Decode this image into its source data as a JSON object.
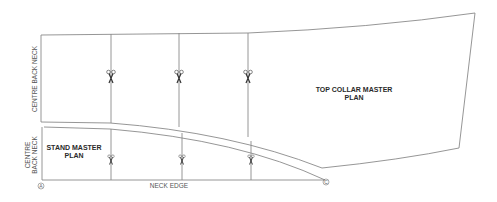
{
  "diagram": {
    "type": "pattern-drafting",
    "pieces": [
      {
        "name": "top-collar",
        "label_line1": "TOP COLLAR MASTER",
        "label_line2": "PLAN"
      },
      {
        "name": "stand",
        "label_line1": "STAND MASTER",
        "label_line2": "PLAN"
      }
    ],
    "labels": {
      "top_side": "CENTRE BACK NECK",
      "stand_side_line1": "CENTRE",
      "stand_side_line2": "BACK NECK",
      "bottom_edge": "NECK EDGE",
      "point_a": "A",
      "point_c": "C"
    },
    "colors": {
      "line": "#8a8a8a",
      "text": "#2a2a2a",
      "background": "#ffffff"
    },
    "cut_markers": {
      "icon": "scissors-icon",
      "top_collar_count": 3,
      "stand_count": 3
    }
  }
}
